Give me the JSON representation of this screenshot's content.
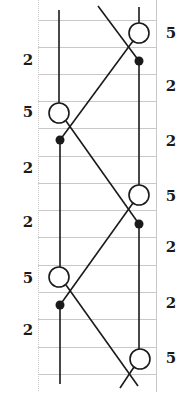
{
  "diagram": {
    "type": "two-strand braid / kinematic timing diagram",
    "colors": {
      "line": "#1a1a1a",
      "grid": "#c8c8c8",
      "background": "#ffffff"
    },
    "grid": {
      "x_left": 38,
      "x_right": 156,
      "y_top": 0,
      "y_bottom": 392,
      "rows_y": [
        20,
        47,
        74,
        101,
        128,
        156,
        183,
        210,
        237,
        265,
        292,
        319,
        347,
        374
      ]
    },
    "strands": {
      "left_x": 59,
      "right_x": 139
    },
    "left_labels": [
      {
        "text": "2",
        "y": 60
      },
      {
        "text": "5",
        "y": 112
      },
      {
        "text": "2",
        "y": 168
      },
      {
        "text": "2",
        "y": 222
      },
      {
        "text": "5",
        "y": 278
      },
      {
        "text": "2",
        "y": 330
      }
    ],
    "right_labels": [
      {
        "text": "5",
        "y": 33
      },
      {
        "text": "2",
        "y": 86
      },
      {
        "text": "2",
        "y": 141
      },
      {
        "text": "5",
        "y": 196
      },
      {
        "text": "2",
        "y": 247
      },
      {
        "text": "2",
        "y": 303
      },
      {
        "text": "5",
        "y": 358
      }
    ],
    "open_circles": [
      {
        "x": 139,
        "y": 33
      },
      {
        "x": 59,
        "y": 113
      },
      {
        "x": 139,
        "y": 195
      },
      {
        "x": 59,
        "y": 277
      },
      {
        "x": 140,
        "y": 359
      }
    ],
    "filled_dots": [
      {
        "x": 139,
        "y": 61
      },
      {
        "x": 60,
        "y": 140
      },
      {
        "x": 139,
        "y": 224
      },
      {
        "x": 60,
        "y": 305
      }
    ]
  }
}
